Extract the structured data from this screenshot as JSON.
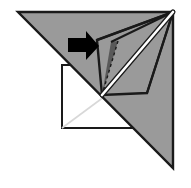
{
  "figure": {
    "canvas": {
      "width": 191,
      "height": 188,
      "background": "#ffffff"
    },
    "palette": {
      "paper_front": "#9a9a9a",
      "paper_back": "#ffffff",
      "flap_shadow": "#595959",
      "outline": "#1a1a1a",
      "hidden_edge": "#d8d8d8",
      "crease_highlight": "#ffffff",
      "arrow": "#000000"
    },
    "shapes": {
      "main_triangle": {
        "name": "folded-paper-triangle",
        "fill": "#9a9a9a",
        "stroke": "#1a1a1a",
        "stroke_width": 2.4,
        "points": "18,12 173,12 173,168"
      },
      "base_square": {
        "name": "underlying-square",
        "fill": "#ffffff",
        "stroke": "#1a1a1a",
        "stroke_width": 2.0,
        "points": "62,65 147,65 147,128 62,128"
      },
      "hidden_diagonal": {
        "name": "hidden-crease-line",
        "stroke": "#d8d8d8",
        "stroke_width": 1.6,
        "from": "62,128",
        "to": "147,65"
      },
      "flap_quad": {
        "name": "raised-flap-panel",
        "fill": "#9a9a9a",
        "stroke": "#1a1a1a",
        "stroke_width": 2.4,
        "points": "97,40 173,12 147,93 102,95"
      },
      "flap_shadow": {
        "name": "flap-shadow-wedge",
        "fill": "#595959",
        "stroke": "none",
        "points": "102,95 111,42 118,41"
      },
      "flap_shadow_dashes": {
        "name": "flap-shadow-dashed-edge",
        "stroke": "#1a1a1a",
        "stroke_width": 1.4,
        "dash": "3 3",
        "from": "118,41",
        "to": "102,95"
      },
      "crease_highlight": {
        "name": "crease-highlight-line",
        "stroke": "#ffffff",
        "stroke_width": 2.6,
        "casing": "#1a1a1a",
        "casing_width": 5.0,
        "from": "102,95",
        "to": "173,12"
      },
      "fan_lines": {
        "name": "fold-fan-lines",
        "stroke": "#1a1a1a",
        "stroke_width": 2.0,
        "apex": "173,12",
        "targets": [
          "97,40",
          "111,42",
          "102,95",
          "147,93"
        ]
      },
      "arrow": {
        "name": "fold-direction-arrow",
        "fill": "#000000",
        "points": "68,38 86,38 86,31 99,46 86,60 86,52 68,52"
      }
    }
  }
}
